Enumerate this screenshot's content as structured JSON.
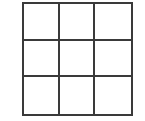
{
  "board": {
    "rows": 3,
    "cols": 3,
    "line_color": "#3a3a3a",
    "cells": [
      "",
      "",
      "",
      "",
      "",
      "",
      "",
      "",
      ""
    ]
  }
}
